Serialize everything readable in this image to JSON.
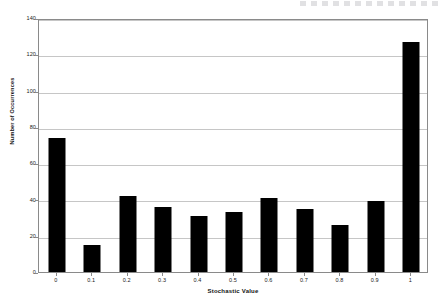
{
  "chart_data": {
    "type": "bar",
    "title": "",
    "subtitle": "",
    "xlabel": "Stochastic Value",
    "ylabel": "Number of Occurrences",
    "categories": [
      "0",
      "0.1",
      "0.2",
      "0.3",
      "0.4",
      "0.5",
      "0.6",
      "0.7",
      "0.8",
      "0.9",
      "1"
    ],
    "values": [
      74,
      15,
      42,
      36,
      31,
      33,
      41,
      35,
      26,
      39,
      127
    ],
    "ylim": [
      0,
      140
    ],
    "yticks": [
      "0",
      "20",
      "40",
      "60",
      "80",
      "100",
      "120",
      "140"
    ],
    "ytick_values": [
      0,
      20,
      40,
      60,
      80,
      100,
      120,
      140
    ],
    "grid": "horizontal",
    "legend": "none",
    "bar_color": "#000000",
    "gridline_color": "#c6c6c6",
    "frame_color": "#8a8a8a",
    "background_color": "#ffffff"
  }
}
